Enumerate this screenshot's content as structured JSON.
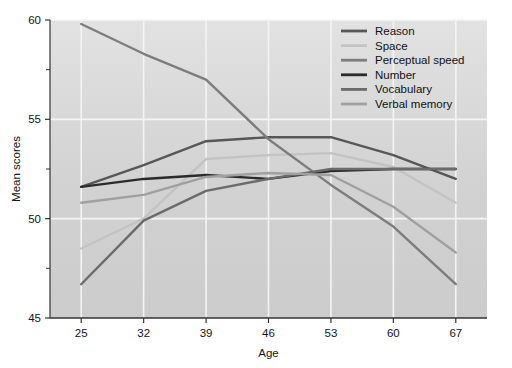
{
  "chart_data": {
    "type": "line",
    "title": "",
    "xlabel": "Age",
    "ylabel": "Mean scores",
    "x": [
      25,
      32,
      39,
      46,
      53,
      60,
      67
    ],
    "xlim": [
      21.5,
      70.5
    ],
    "ylim": [
      45,
      60
    ],
    "yticks": [
      45,
      50,
      55,
      60
    ],
    "yticks_minor": [
      47.5,
      52.5,
      57.5
    ],
    "grid": "horizontal and vertical white gridlines",
    "legend_position": "top-right inside plot area",
    "background": "#d4d4d4",
    "series": [
      {
        "name": "Reason",
        "color": "#575757",
        "values": [
          51.6,
          52.7,
          53.9,
          54.1,
          54.1,
          53.2,
          52.0
        ]
      },
      {
        "name": "Space",
        "color": "#c3c3c3",
        "values": [
          48.5,
          50.0,
          53.0,
          53.2,
          53.3,
          52.6,
          50.8
        ]
      },
      {
        "name": "Perceptual speed",
        "color": "#7d7d7d",
        "values": [
          59.8,
          58.3,
          57.0,
          54.0,
          51.7,
          49.6,
          46.7
        ]
      },
      {
        "name": "Number",
        "color": "#2b2b2b",
        "values": [
          51.6,
          52.0,
          52.2,
          52.0,
          52.4,
          52.5,
          52.5
        ]
      },
      {
        "name": "Vocabulary",
        "color": "#6b6b6b",
        "values": [
          46.7,
          49.9,
          51.4,
          52.0,
          52.5,
          52.5,
          52.5
        ]
      },
      {
        "name": "Verbal memory",
        "color": "#a0a0a0",
        "values": [
          50.8,
          51.2,
          52.1,
          52.3,
          52.2,
          50.6,
          48.3
        ]
      }
    ]
  }
}
